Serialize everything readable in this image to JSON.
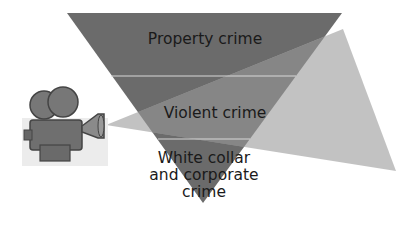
{
  "diagram": {
    "type": "inverted-pyramid",
    "colors": {
      "pyramid": "#6b6b6b",
      "spotlight": "#bdbdbd",
      "divider": "#d8d8d8",
      "text": "#1a1a1a"
    },
    "levels": [
      {
        "label": "Property crime"
      },
      {
        "label": "Violent crime"
      },
      {
        "label_lines": [
          "White collar",
          "and corporate",
          "crime"
        ]
      }
    ],
    "camera_icon": "movie-camera-icon"
  }
}
